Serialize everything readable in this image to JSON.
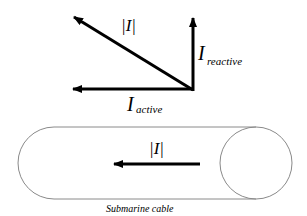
{
  "diagram": {
    "phasor": {
      "magnitude_label": "|I|",
      "reactive_main": "I",
      "reactive_sub": "reactive",
      "active_main": "I",
      "active_sub": "active"
    },
    "cable": {
      "current_label": "|I|",
      "caption": "Submarine cable"
    },
    "colors": {
      "arrow": "#000000",
      "outline": "#8a8a8a"
    }
  }
}
